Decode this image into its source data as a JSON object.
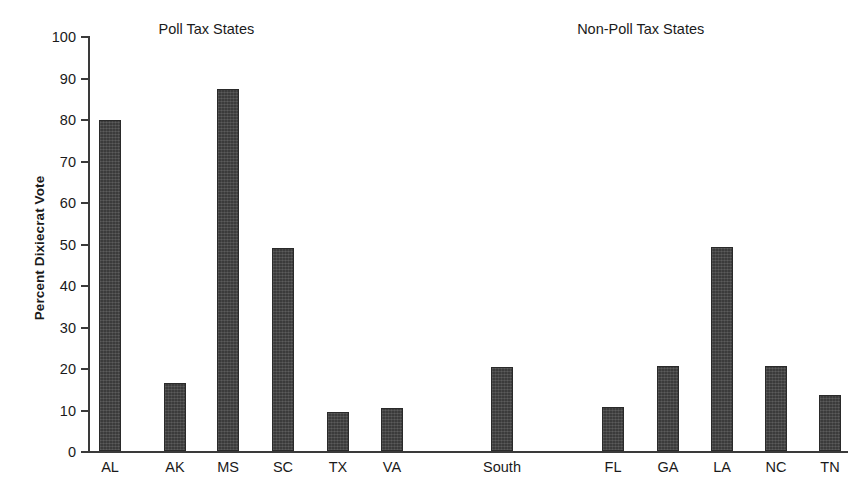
{
  "chart_data": {
    "type": "bar",
    "title": "",
    "xlabel": "",
    "ylabel": "Percent Dixiecrat Vote",
    "ylim": [
      0,
      100
    ],
    "ytick_step": 10,
    "yticks": [
      0,
      10,
      20,
      30,
      40,
      50,
      60,
      70,
      80,
      90,
      100
    ],
    "ytick_labels": [
      "0",
      "10",
      "20",
      "30",
      "40",
      "50",
      "60",
      "70",
      "80",
      "90",
      "100"
    ],
    "grid": false,
    "legend": "none",
    "bar_color": "#3b3b3b",
    "group_titles": [
      {
        "label": "Poll Tax States",
        "center_x_pct": 24.0
      },
      {
        "label": "Non-Poll Tax States",
        "center_x_pct": 74.5
      }
    ],
    "categories": [
      "AL",
      "AK",
      "MS",
      "SC",
      "TX",
      "VA",
      "South",
      "FL",
      "GA",
      "LA",
      "NC",
      "TN"
    ],
    "values": [
      79.8,
      16.5,
      87.2,
      49.0,
      9.3,
      10.3,
      20.2,
      10.5,
      20.6,
      49.2,
      20.6,
      13.4
    ],
    "bars": [
      {
        "category": "AL",
        "value": 79.8,
        "group": "Poll Tax States",
        "center_x": 110
      },
      {
        "category": "AK",
        "value": 16.5,
        "group": "Poll Tax States",
        "center_x": 175
      },
      {
        "category": "MS",
        "value": 87.2,
        "group": "Poll Tax States",
        "center_x": 228
      },
      {
        "category": "SC",
        "value": 49.0,
        "group": "Poll Tax States",
        "center_x": 283
      },
      {
        "category": "TX",
        "value": 9.3,
        "group": "Poll Tax States",
        "center_x": 338
      },
      {
        "category": "VA",
        "value": 10.3,
        "group": "Poll Tax States",
        "center_x": 392
      },
      {
        "category": "South",
        "value": 20.2,
        "group": "",
        "center_x": 502
      },
      {
        "category": "FL",
        "value": 10.5,
        "group": "Non-Poll Tax States",
        "center_x": 613
      },
      {
        "category": "GA",
        "value": 20.6,
        "group": "Non-Poll Tax States",
        "center_x": 668
      },
      {
        "category": "LA",
        "value": 49.2,
        "group": "Non-Poll Tax States",
        "center_x": 722
      },
      {
        "category": "NC",
        "value": 20.6,
        "group": "Non-Poll Tax States",
        "center_x": 776
      },
      {
        "category": "TN",
        "value": 13.4,
        "group": "Non-Poll Tax States",
        "center_x": 830
      }
    ]
  }
}
